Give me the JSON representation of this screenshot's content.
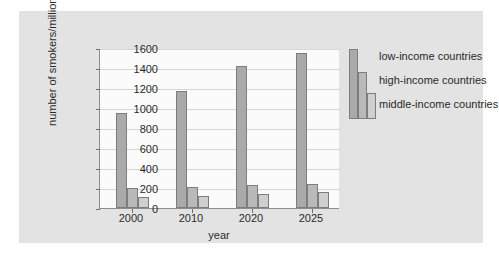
{
  "chart_data": {
    "type": "bar",
    "title": "",
    "xlabel": "year",
    "ylabel": "number of smokers/millions",
    "categories": [
      "2000",
      "2010",
      "2020",
      "2025"
    ],
    "ylim": [
      0,
      1600
    ],
    "yticks": [
      0,
      200,
      400,
      600,
      800,
      1000,
      1200,
      1400,
      1600
    ],
    "ytick_labels": [
      "0",
      "200",
      "400",
      "600",
      "800",
      "1000",
      "1200",
      "1400",
      "1600"
    ],
    "grid": true,
    "legend_position": "right",
    "series": [
      {
        "name": "low-income countries",
        "color": "#aaaaaa",
        "values": [
          950,
          1170,
          1425,
          1550
        ]
      },
      {
        "name": "high-income countries",
        "color": "#b9b9b9",
        "values": [
          200,
          215,
          235,
          245
        ]
      },
      {
        "name": "middle-income countries",
        "color": "#cfcfcf",
        "values": [
          115,
          125,
          145,
          165
        ]
      }
    ]
  },
  "colors": {
    "page_background": "#ffffff",
    "panel_background": "#e3e3e3",
    "plot_background": "#fbfbfb",
    "gridline": "#d6d6d6",
    "axis": "#8d8d8d",
    "text": "#2a2a2a",
    "bar_border": "#7d7d7d"
  }
}
